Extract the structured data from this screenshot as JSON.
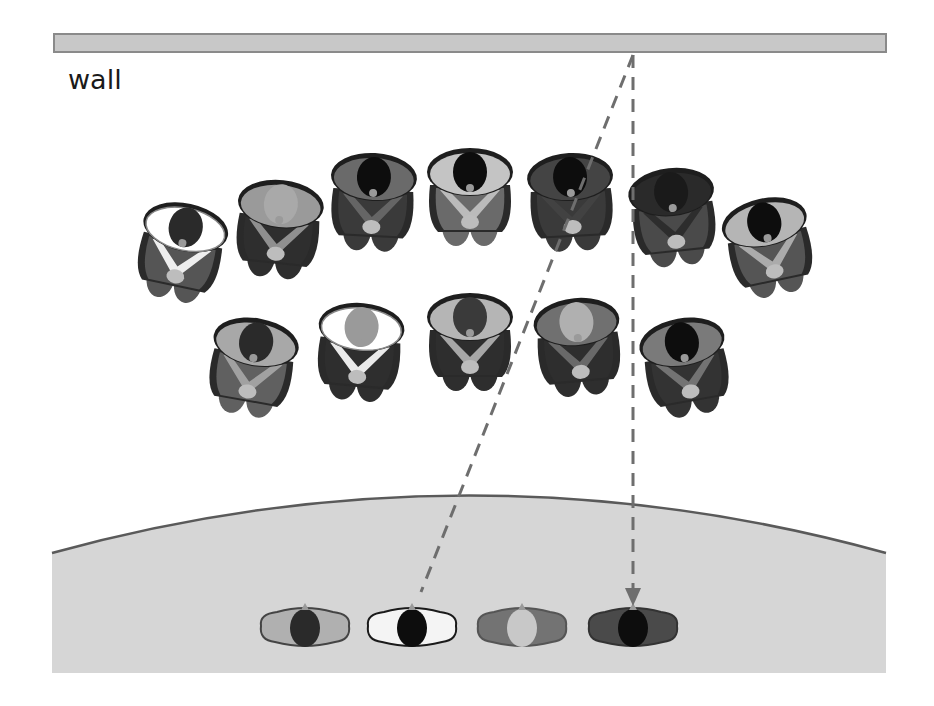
{
  "diagram": {
    "wall_label": "wall",
    "colors": {
      "wall_fill": "#c8c8c8",
      "wall_stroke": "#8a8a8a",
      "stage_fill": "#d6d6d6",
      "stage_edge": "#5a5a5a",
      "dash_line": "#6e6e6e",
      "hair_dark": "#0d0d0d",
      "skin_light": "#bdbdbd"
    },
    "wall": {
      "x": 54,
      "y": 34,
      "width": 832,
      "height": 18
    },
    "stage": {
      "left": 52,
      "right": 886,
      "edge_y": 553,
      "apex_y": 495,
      "bottom": 673
    },
    "sight_lines": [
      {
        "name": "diagonal-sight-line",
        "from": [
          633,
          55
        ],
        "to": [
          421,
          592
        ],
        "arrow": false
      },
      {
        "name": "vertical-sight-line",
        "from": [
          633,
          55
        ],
        "to": [
          633,
          603
        ],
        "arrow": true
      }
    ],
    "audience_back_row": [
      {
        "cx": 182,
        "cy": 245,
        "rot": 12,
        "collar": "#ffffff",
        "suit": "#555555",
        "hair": "#2a2a2a"
      },
      {
        "cx": 279,
        "cy": 222,
        "rot": 6,
        "collar": "#9a9a9a",
        "suit": "#2e2e2e",
        "hair": "#a9a9a9"
      },
      {
        "cx": 373,
        "cy": 195,
        "rot": 3,
        "collar": "#6a6a6a",
        "suit": "#3a3a3a",
        "hair": "#0d0d0d"
      },
      {
        "cx": 470,
        "cy": 190,
        "rot": 0,
        "collar": "#c4c4c4",
        "suit": "#6a6a6a",
        "hair": "#0d0d0d"
      },
      {
        "cx": 571,
        "cy": 195,
        "rot": -3,
        "collar": "#444444",
        "suit": "#3a3a3a",
        "hair": "#0d0d0d"
      },
      {
        "cx": 673,
        "cy": 210,
        "rot": -6,
        "collar": "#2a2a2a",
        "suit": "#4a4a4a",
        "hair": "#1a1a1a"
      },
      {
        "cx": 768,
        "cy": 240,
        "rot": -12,
        "collar": "#b5b5b5",
        "suit": "#555555",
        "hair": "#0d0d0d"
      }
    ],
    "audience_front_row": [
      {
        "cx": 253,
        "cy": 360,
        "rot": 10,
        "collar": "#a8a8a8",
        "suit": "#606060",
        "hair": "#2a2a2a"
      },
      {
        "cx": 360,
        "cy": 345,
        "rot": 5,
        "collar": "#ffffff",
        "suit": "#2e2e2e",
        "hair": "#9a9a9a"
      },
      {
        "cx": 470,
        "cy": 335,
        "rot": 0,
        "collar": "#b5b5b5",
        "suit": "#2e2e2e",
        "hair": "#3a3a3a"
      },
      {
        "cx": 578,
        "cy": 340,
        "rot": -5,
        "collar": "#707070",
        "suit": "#2e2e2e",
        "hair": "#b0b0b0"
      },
      {
        "cx": 685,
        "cy": 360,
        "rot": -10,
        "collar": "#7a7a7a",
        "suit": "#333333",
        "hair": "#0d0d0d"
      }
    ],
    "performers": [
      {
        "cx": 305,
        "cy": 630,
        "body": "#b0b0b0",
        "outline": "#444444",
        "head": "#2a2a2a"
      },
      {
        "cx": 412,
        "cy": 630,
        "body": "#f4f4f4",
        "outline": "#1a1a1a",
        "head": "#0d0d0d"
      },
      {
        "cx": 522,
        "cy": 630,
        "body": "#737373",
        "outline": "#555555",
        "head": "#c8c8c8"
      },
      {
        "cx": 633,
        "cy": 630,
        "body": "#4a4a4a",
        "outline": "#333333",
        "head": "#0d0d0d"
      }
    ]
  }
}
